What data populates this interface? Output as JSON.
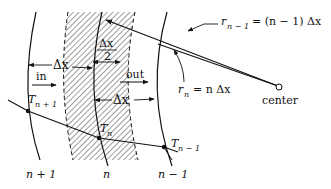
{
  "diagram": {
    "type": "finite-difference cylindrical shell nodes",
    "labels": {
      "delta_x_top": "Δx",
      "half_delta_num": "Δx",
      "half_delta_den": "2",
      "in": "in",
      "out": "out",
      "delta_x_mid": "Δx",
      "r_n_minus_1_lhs": "r",
      "r_n_minus_1_sub": "n − 1",
      "r_n_minus_1_rhs": "= (n − 1) Δx",
      "r_n_lhs": "r",
      "r_n_sub": "n",
      "r_n_rhs": "= n Δx",
      "center": "center",
      "T_np1": "T",
      "T_np1_sub": "n + 1",
      "T_n": "T",
      "T_n_sub": "n",
      "T_nm1": "T",
      "T_nm1_sub": "n − 1",
      "node_np1": "n + 1",
      "node_n": "n",
      "node_nm1": "n − 1"
    },
    "nodes": [
      {
        "name": "n+1",
        "temp": "T_{n+1}"
      },
      {
        "name": "n",
        "temp": "T_n"
      },
      {
        "name": "n-1",
        "temp": "T_{n-1}"
      }
    ],
    "colors": {
      "line": "#111111",
      "background": "#ffffff"
    }
  }
}
